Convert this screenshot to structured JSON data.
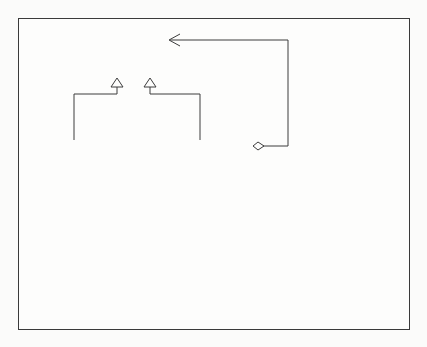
{
  "diagram": {
    "type": "UML class diagram",
    "classes": [
      {
        "id": "component",
        "name": "Component",
        "abstract": true,
        "attributes": [],
        "operations": [
          "+Operation()"
        ]
      },
      {
        "id": "concrete_component",
        "name": "ConcreteComponent",
        "abstract": false,
        "attributes": [],
        "operations": [
          "+Operation()"
        ]
      },
      {
        "id": "decorator",
        "name": "Decorator",
        "abstract": true,
        "attributes": [],
        "operations": [
          "+Operation()"
        ]
      },
      {
        "id": "concrete_decorator_a",
        "name": "ConcreteDecoratorA",
        "abstract": false,
        "attributes": [
          "-addedState"
        ],
        "operations": [
          "+Operation()"
        ]
      },
      {
        "id": "concrete_decorator_b",
        "name": "ConcreteDecoratorB",
        "abstract": false,
        "attributes": [],
        "operations": [
          "+Operation()",
          "+AddedBehavior()"
        ]
      }
    ],
    "relationships": [
      {
        "type": "generalization",
        "from": "ConcreteComponent",
        "to": "Component"
      },
      {
        "type": "generalization",
        "from": "Decorator",
        "to": "Component"
      },
      {
        "type": "generalization",
        "from": "ConcreteDecoratorA",
        "to": "Decorator"
      },
      {
        "type": "generalization",
        "from": "ConcreteDecoratorB",
        "to": "Decorator"
      },
      {
        "type": "aggregation",
        "from": "Decorator",
        "to": "Component",
        "role": "component"
      }
    ],
    "association_label": "component",
    "notes": [
      {
        "id": "note_decorator",
        "attached_to": "Decorator.Operation()",
        "lines": [
          "component.Operation()"
        ]
      },
      {
        "id": "note_decorator_b",
        "attached_to": "ConcreteDecoratorB.Operation()",
        "lines": [
          "base.Operation();",
          "AddedBehavior();"
        ]
      }
    ],
    "colors": {
      "line": "#3c3c3c",
      "background": "#fdfdfc"
    }
  }
}
